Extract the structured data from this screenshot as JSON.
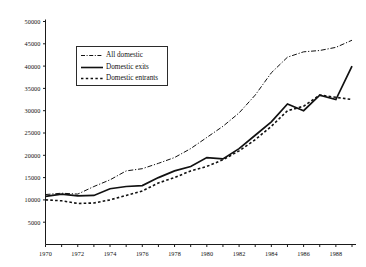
{
  "chart_data": {
    "type": "line",
    "title": "",
    "subtitle": "",
    "xlabel": "",
    "ylabel": "",
    "xlim": [
      1970,
      1989
    ],
    "ylim": [
      0,
      50000
    ],
    "grid": false,
    "legend_position": "upper-left-inside",
    "x": [
      1970,
      1971,
      1972,
      1973,
      1974,
      1975,
      1976,
      1977,
      1978,
      1979,
      1980,
      1981,
      1982,
      1983,
      1984,
      1985,
      1986,
      1987,
      1988,
      1989
    ],
    "xtick_labels": [
      "1970",
      "1972",
      "1974",
      "1976",
      "1978",
      "1980",
      "1982",
      "1984",
      "1986",
      "1988"
    ],
    "xtick_values": [
      1970,
      1972,
      1974,
      1976,
      1978,
      1980,
      1982,
      1984,
      1986,
      1988
    ],
    "ytick_labels": [
      "5000",
      "10000",
      "15000",
      "20000",
      "25000",
      "30000",
      "35000",
      "40000",
      "45000",
      "50000"
    ],
    "ytick_values": [
      5000,
      10000,
      15000,
      20000,
      25000,
      30000,
      35000,
      40000,
      45000,
      50000
    ],
    "series": [
      {
        "name": "All domestic",
        "style": "dash-dot",
        "color": "#111111",
        "values": [
          11200,
          11500,
          11300,
          13000,
          14500,
          16500,
          17000,
          18200,
          19500,
          21500,
          24000,
          26500,
          29500,
          33500,
          38500,
          42000,
          43200,
          43500,
          44200,
          45800
        ]
      },
      {
        "name": "Domestic exits",
        "style": "solid",
        "color": "#111111",
        "values": [
          10800,
          11300,
          10900,
          11000,
          12500,
          13000,
          13200,
          15000,
          16500,
          17500,
          19500,
          19200,
          21500,
          24500,
          27500,
          31500,
          30000,
          33500,
          32500,
          40000
        ]
      },
      {
        "name": "Domestic entrants",
        "style": "dotted",
        "color": "#111111",
        "values": [
          10000,
          9800,
          9200,
          9300,
          10000,
          11000,
          12000,
          13800,
          15000,
          16500,
          17500,
          19000,
          21000,
          23500,
          26500,
          30000,
          31000,
          33500,
          33000,
          32500
        ]
      }
    ]
  },
  "legend": {
    "entries": [
      {
        "label": "All domestic",
        "sample": "dash-dot-line"
      },
      {
        "label": "Domestic exits",
        "sample": "solid-line"
      },
      {
        "label": "Domestic entrants",
        "sample": "dotted-line"
      }
    ]
  },
  "axes": {
    "axis_color": "#1a1a1a"
  }
}
